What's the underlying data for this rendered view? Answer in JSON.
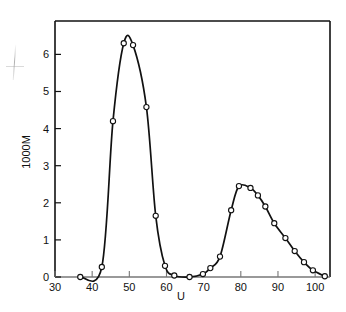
{
  "chart_data": {
    "type": "line",
    "title": "",
    "subtitle": "",
    "xlabel": "U",
    "ylabel": "1000M",
    "xlim": [
      30,
      104
    ],
    "ylim": [
      0,
      6.9
    ],
    "x_ticks": [
      30,
      40,
      50,
      60,
      70,
      80,
      90,
      100
    ],
    "x_tick_labels": [
      "30",
      "40",
      "50",
      "60",
      "70",
      "80",
      "90",
      "100"
    ],
    "y_ticks": [
      0,
      1,
      2,
      3,
      4,
      5,
      6
    ],
    "y_tick_labels": [
      "0",
      "1",
      "2",
      "3",
      "4",
      "5",
      "6"
    ],
    "grid": false,
    "legend": null,
    "marker": "open-circle",
    "line_color": "#111111",
    "marker_face_color": "#ffffff",
    "marker_edge_color": "#111111",
    "series": [
      {
        "name": "1000M vs U",
        "points": [
          {
            "x": 36.8,
            "y": 0.0
          },
          {
            "x": 42.6,
            "y": 0.27
          },
          {
            "x": 45.6,
            "y": 4.2
          },
          {
            "x": 48.5,
            "y": 6.3
          },
          {
            "x": 51.0,
            "y": 6.25
          },
          {
            "x": 54.6,
            "y": 4.58
          },
          {
            "x": 57.1,
            "y": 1.65
          },
          {
            "x": 59.6,
            "y": 0.3
          },
          {
            "x": 62.1,
            "y": 0.04
          },
          {
            "x": 66.2,
            "y": 0.0
          },
          {
            "x": 69.8,
            "y": 0.08
          },
          {
            "x": 71.8,
            "y": 0.24
          },
          {
            "x": 74.4,
            "y": 0.55
          },
          {
            "x": 77.4,
            "y": 1.8
          },
          {
            "x": 79.5,
            "y": 2.45
          },
          {
            "x": 82.6,
            "y": 2.4
          },
          {
            "x": 84.6,
            "y": 2.2
          },
          {
            "x": 86.6,
            "y": 1.9
          },
          {
            "x": 89.0,
            "y": 1.45
          },
          {
            "x": 92.0,
            "y": 1.05
          },
          {
            "x": 94.5,
            "y": 0.7
          },
          {
            "x": 97.0,
            "y": 0.4
          },
          {
            "x": 99.4,
            "y": 0.18
          },
          {
            "x": 102.6,
            "y": 0.02
          }
        ],
        "peaks": [
          {
            "center": 50.0,
            "height": 6.6,
            "label": "peak-1"
          },
          {
            "center": 81.0,
            "height": 2.55,
            "label": "peak-2"
          }
        ]
      }
    ]
  }
}
